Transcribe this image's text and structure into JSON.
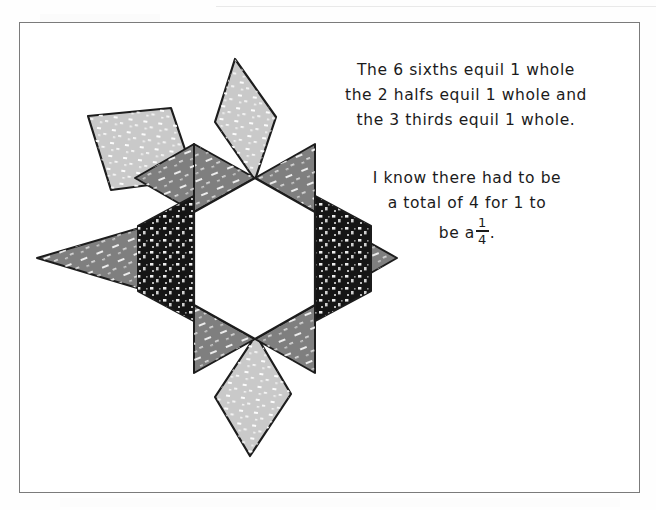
{
  "page": {
    "background_color": "#ffffff",
    "frame_border_color": "#7b7b7b"
  },
  "handwriting": {
    "paragraph_one": {
      "lines": [
        "The 6 sixths equil  1 whole",
        "the 2 halfs equil  1 whole and",
        "the 3 thirds equil  1 whole."
      ]
    },
    "paragraph_two": {
      "lines": [
        "I know there had to be",
        "a total of 4 for 1 to",
        "be  a"
      ],
      "fraction": {
        "numerator": "1",
        "denominator": "4",
        "trailing_punctuation": "."
      }
    }
  },
  "figure": {
    "colors": {
      "hexagon_fill": "#ffffff",
      "triangle_fill": "#7f7f7f",
      "trapezoid_fill": "#151515",
      "rhombus_fill": "#c9c9c9",
      "outline": "#1c1c1c",
      "speckle": "#ffffff"
    },
    "pieces": [
      {
        "name": "hexagon-center",
        "shape": "hexagon",
        "fill": "#ffffff",
        "count": 1
      },
      {
        "name": "triangle-upper-left",
        "shape": "triangle",
        "fill": "#7f7f7f"
      },
      {
        "name": "triangle-upper-right",
        "shape": "triangle",
        "fill": "#7f7f7f"
      },
      {
        "name": "triangle-left",
        "shape": "triangle",
        "fill": "#7f7f7f"
      },
      {
        "name": "triangle-right",
        "shape": "triangle",
        "fill": "#7f7f7f"
      },
      {
        "name": "triangle-lower-left",
        "shape": "triangle",
        "fill": "#7f7f7f"
      },
      {
        "name": "triangle-lower-right",
        "shape": "triangle",
        "fill": "#7f7f7f"
      },
      {
        "name": "trapezoid-left",
        "shape": "trapezoid",
        "fill": "#151515"
      },
      {
        "name": "trapezoid-right",
        "shape": "trapezoid",
        "fill": "#151515"
      },
      {
        "name": "rhombus-top",
        "shape": "rhombus",
        "fill": "#c9c9c9"
      },
      {
        "name": "rhombus-bottom",
        "shape": "rhombus",
        "fill": "#c9c9c9"
      },
      {
        "name": "rhombus-upper-left",
        "shape": "rhombus",
        "fill": "#c9c9c9"
      }
    ]
  }
}
